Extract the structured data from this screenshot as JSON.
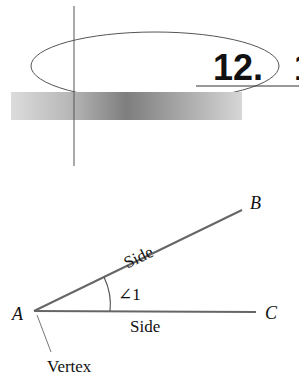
{
  "header": {
    "chapter_number": "12.",
    "chapter_number_partial_next": "1"
  },
  "diagram": {
    "points": {
      "a": "A",
      "b": "B",
      "c": "C"
    },
    "angle_label": "∠1",
    "side_upper_label": "Side",
    "side_lower_label": "Side",
    "vertex_label": "Vertex"
  },
  "colors": {
    "line": "#555555",
    "ray": "#666666",
    "text": "#111111",
    "bar_light": "#d8d8d8",
    "bar_dark": "#7a7a7a"
  }
}
